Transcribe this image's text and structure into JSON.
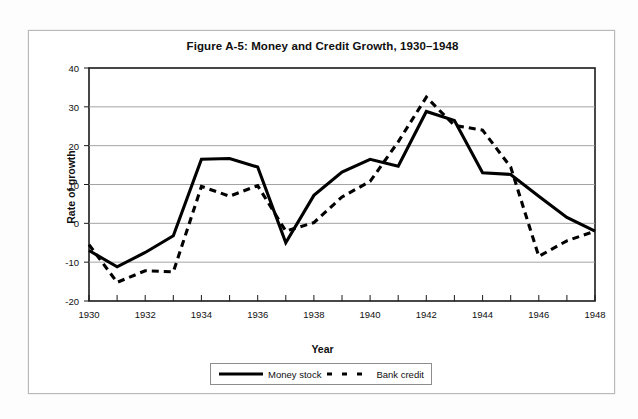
{
  "figure": {
    "title": "Figure A-5: Money and Credit Growth, 1930–1948",
    "frame_color": "#b9b9b9",
    "background": "#ffffff"
  },
  "axes": {
    "x_title": "Year",
    "y_title": "Rate of growth"
  },
  "legend": {
    "items": [
      {
        "label": "Money stock",
        "style": "solid",
        "color": "#000000"
      },
      {
        "label": "Bank credit",
        "style": "dashed",
        "color": "#000000"
      }
    ]
  },
  "chart_data": {
    "type": "line",
    "title": "Figure A-5: Money and Credit Growth, 1930–1948",
    "xlabel": "Year",
    "ylabel": "Rate of growth",
    "xlim": [
      1930,
      1948
    ],
    "ylim": [
      -20,
      40
    ],
    "ytick_labels": [
      "40",
      "30",
      "20",
      "10",
      "0",
      "-10",
      "-20"
    ],
    "yticks": [
      40,
      30,
      20,
      10,
      0,
      -10,
      -20
    ],
    "xtick_labels": [
      "1930",
      "1932",
      "1934",
      "1936",
      "1938",
      "1940",
      "1942",
      "1944",
      "1946",
      "1948"
    ],
    "xticks": [
      1930,
      1932,
      1934,
      1936,
      1938,
      1940,
      1942,
      1944,
      1946,
      1948
    ],
    "grid": "horizontal",
    "legend_position": "bottom",
    "x": [
      1930,
      1931,
      1932,
      1933,
      1934,
      1935,
      1936,
      1937,
      1938,
      1939,
      1940,
      1941,
      1942,
      1943,
      1944,
      1945,
      1946,
      1947,
      1948
    ],
    "series": [
      {
        "name": "Money stock",
        "style": "solid",
        "color": "#000000",
        "values": [
          -7.0,
          -11.2,
          -7.5,
          -3.2,
          16.5,
          16.7,
          14.5,
          -5.0,
          7.2,
          13.2,
          16.5,
          14.7,
          28.8,
          26.5,
          13.0,
          12.6,
          7.0,
          1.5,
          -2.0
        ]
      },
      {
        "name": "Bank credit",
        "style": "dashed",
        "color": "#000000",
        "values": [
          -5.5,
          -15.2,
          -12.2,
          -12.5,
          9.5,
          7.0,
          9.7,
          -2.0,
          0.2,
          6.8,
          10.8,
          21.0,
          32.5,
          25.2,
          24.0,
          14.5,
          -8.5,
          -4.5,
          -2.0
        ]
      }
    ]
  }
}
